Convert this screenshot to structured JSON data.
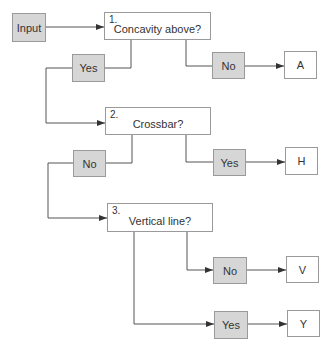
{
  "diagram": {
    "input": {
      "label": "Input"
    },
    "questions": [
      {
        "number": "1.",
        "text": "Concavity above?"
      },
      {
        "number": "2.",
        "text": "Crossbar?"
      },
      {
        "number": "3.",
        "text": "Vertical line?"
      }
    ],
    "answers": [
      {
        "label": "Yes"
      },
      {
        "label": "No"
      },
      {
        "label": "No"
      },
      {
        "label": "Yes"
      },
      {
        "label": "No"
      },
      {
        "label": "Yes"
      }
    ],
    "outputs": [
      {
        "label": "A"
      },
      {
        "label": "H"
      },
      {
        "label": "V"
      },
      {
        "label": "Y"
      }
    ],
    "colors": {
      "decision_fill": "#d6d6d6",
      "line": "#555555"
    }
  }
}
